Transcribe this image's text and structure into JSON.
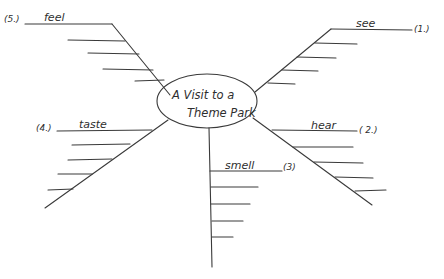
{
  "diagram": {
    "type": "mind-map / fishbone web",
    "center": {
      "line1": "A Visit to a",
      "line2": "Theme Park"
    },
    "branches": [
      {
        "id": "see",
        "number": "(1.)",
        "label": "see"
      },
      {
        "id": "hear",
        "number": "( 2.)",
        "label": "hear"
      },
      {
        "id": "smell",
        "number": "(3)",
        "label": "smell"
      },
      {
        "id": "taste",
        "number": "(4.)",
        "label": "taste"
      },
      {
        "id": "feel",
        "number": "(5.)",
        "label": "feel"
      }
    ],
    "ink_color": "#3a3a3a",
    "background": "#ffffff"
  }
}
